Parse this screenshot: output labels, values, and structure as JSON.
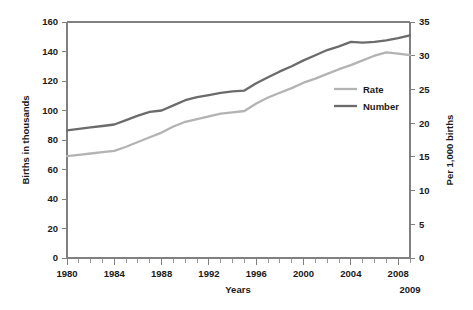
{
  "chart_data": {
    "type": "line",
    "title": "",
    "xlabel": "Years",
    "ylabel": "Births in thousands",
    "y2label": "Per 1,000 births",
    "grid": false,
    "legend_position": "inside-right",
    "xlim": [
      1980,
      2009
    ],
    "ylim": [
      0,
      160
    ],
    "y2lim": [
      0,
      35
    ],
    "x": [
      1980,
      1981,
      1982,
      1983,
      1984,
      1985,
      1986,
      1987,
      1988,
      1989,
      1990,
      1991,
      1992,
      1993,
      1994,
      1995,
      1996,
      1997,
      1998,
      1999,
      2000,
      2001,
      2002,
      2003,
      2004,
      2005,
      2006,
      2007,
      2008,
      2009
    ],
    "x_tick_labels": [
      "1980",
      "1984",
      "1988",
      "1992",
      "1996",
      "2000",
      "2004",
      "2008"
    ],
    "x_tick_values": [
      1980,
      1984,
      1988,
      1992,
      1996,
      2000,
      2004,
      2008
    ],
    "x_end_label": "2009",
    "y_tick_labels": [
      "0",
      "20",
      "40",
      "60",
      "80",
      "100",
      "120",
      "140",
      "160"
    ],
    "y_tick_values": [
      0,
      20,
      40,
      60,
      80,
      100,
      120,
      140,
      160
    ],
    "y2_tick_labels": [
      "0",
      "5",
      "10",
      "15",
      "20",
      "25",
      "30",
      "35"
    ],
    "y2_tick_values": [
      0,
      5,
      10,
      15,
      20,
      25,
      30,
      35
    ],
    "series": [
      {
        "name": "Rate",
        "axis": "right",
        "color": "#b3b3b3",
        "values": [
          15.1,
          15.3,
          15.5,
          15.7,
          15.9,
          16.5,
          17.2,
          17.9,
          18.6,
          19.5,
          20.2,
          20.6,
          21.0,
          21.4,
          21.6,
          21.8,
          22.9,
          23.8,
          24.5,
          25.2,
          26.0,
          26.6,
          27.3,
          28.0,
          28.6,
          29.3,
          30.0,
          30.5,
          30.3,
          30.1
        ]
      },
      {
        "name": "Number",
        "axis": "left",
        "color": "#6b6b6b",
        "values": [
          86.5,
          87.5,
          88.5,
          89.5,
          90.5,
          93.5,
          96.5,
          99.0,
          100.0,
          103.5,
          107.0,
          109.0,
          110.5,
          112.0,
          113.0,
          113.5,
          118.5,
          122.5,
          126.5,
          130.0,
          134.0,
          137.5,
          141.0,
          143.5,
          146.5,
          146.0,
          146.5,
          147.5,
          149.0,
          151.0
        ]
      }
    ],
    "number_series_left_values": [
      86.5,
      87.5,
      88.5,
      89.5,
      90.5,
      93.5,
      96.5,
      99.0,
      100.0,
      103.5,
      107.0,
      109.0,
      110.5,
      112.0,
      113.0,
      113.5,
      118.5,
      122.5,
      126.5,
      130.0,
      134.0,
      137.5,
      141.0,
      143.5,
      146.5,
      146.0,
      146.5,
      147.5,
      149.0,
      151.0
    ],
    "rate_series_left_equivalent": [
      69.0,
      70.0,
      70.9,
      71.8,
      72.7,
      75.4,
      78.6,
      81.8,
      85.0,
      89.1,
      92.3,
      94.2,
      96.0,
      97.8,
      98.7,
      99.7,
      104.7,
      108.8,
      112.0,
      115.2,
      118.9,
      121.6,
      124.8,
      128.0,
      130.7,
      133.9,
      137.1,
      139.4,
      138.5,
      137.6
    ]
  },
  "legend": {
    "entries": [
      {
        "label": "Rate",
        "color": "#b3b3b3"
      },
      {
        "label": "Number",
        "color": "#6b6b6b"
      }
    ]
  },
  "axes": {
    "left_title": "Births in thousands",
    "right_title": "Per 1,000 births",
    "bottom_title": "Years",
    "end_year_label": "2009"
  },
  "colors": {
    "rate": "#b3b3b3",
    "number": "#6b6b6b",
    "axis": "#808080",
    "text": "#1a1a1a",
    "background": "#ffffff"
  }
}
